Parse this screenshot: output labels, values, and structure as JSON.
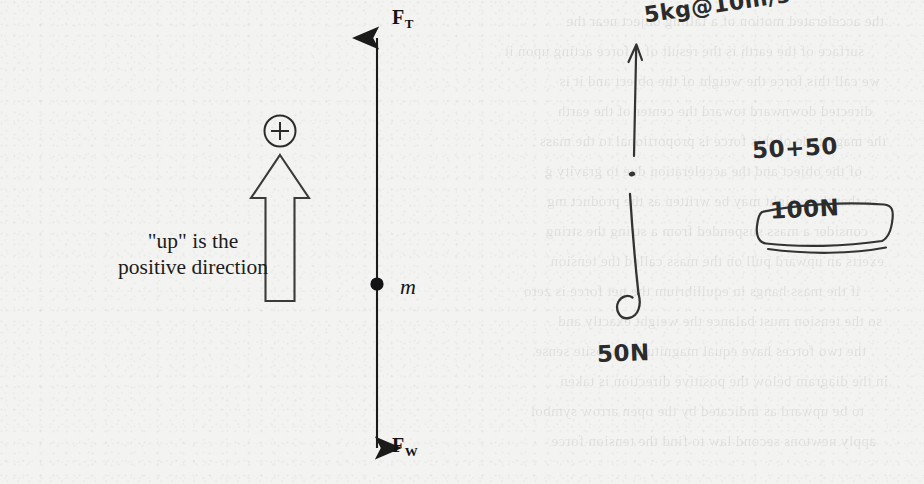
{
  "page": {
    "width": 924,
    "height": 484,
    "background_color": "#f3f3f1",
    "ink_color": "#1b1b1b",
    "pencil_color": "#2b2b2b"
  },
  "diagram": {
    "caption_line1": "\"up\" is the",
    "caption_line2": "positive direction",
    "mass_label": "m",
    "sign_convention_symbol": "+",
    "force_up": {
      "symbol": "F",
      "subscript": "T",
      "direction": "up"
    },
    "force_down": {
      "symbol": "F",
      "subscript": "W",
      "direction": "down"
    }
  },
  "annotations": {
    "top_note": "5kg@10m/s",
    "top_note_exponent": "2",
    "down_note": "50N",
    "sum_note": "50+50",
    "result_note": "100N"
  },
  "bleedthrough": {
    "lines": [
      "the accelerated motion of a falling object near the",
      "surface of the earth is the result of a force acting upon it",
      "we call this force the weight of the object and it is",
      "directed downward toward the center of the earth",
      "the magnitude of this force is proportional to the mass",
      "of the object and the acceleration due to gravity g",
      "so that the weight may be written as the product mg",
      "consider a mass suspended from a string the string",
      "exerts an upward pull on the mass called the tension",
      "if the mass hangs in equilibrium the net force is zero",
      "so the tension must balance the weight exactly and",
      "the two forces have equal magnitude opposite sense",
      "in the diagram below the positive direction is taken",
      "to be upward as indicated by the open arrow symbol",
      "apply newtons second law to find the tension force"
    ]
  }
}
